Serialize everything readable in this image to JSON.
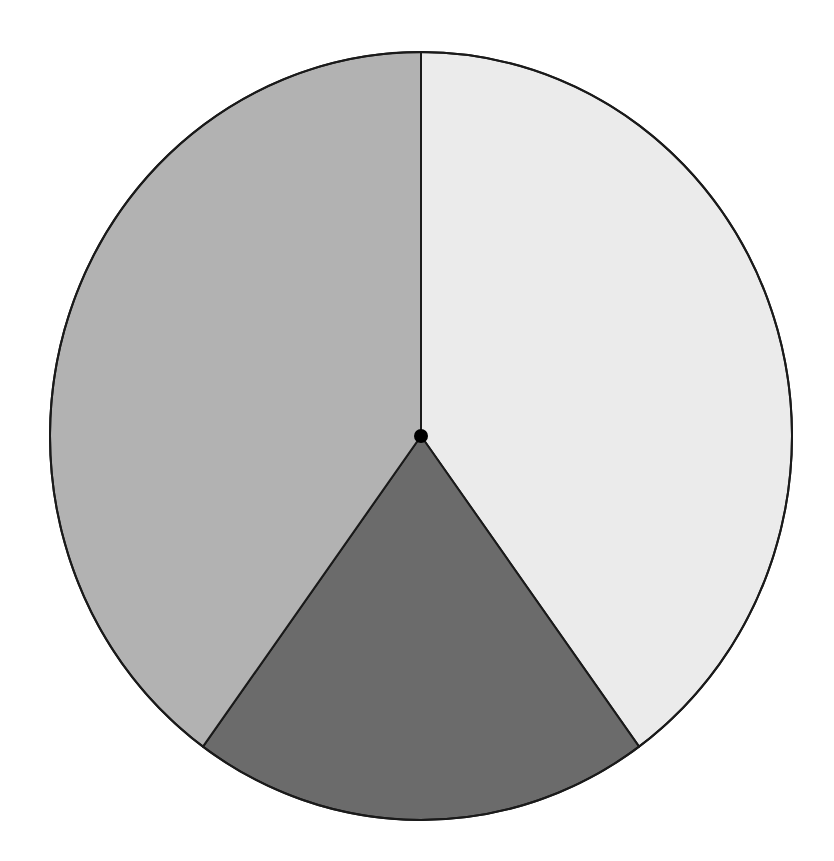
{
  "chart_data": {
    "type": "pie",
    "title": "",
    "categories": [
      "Slice A",
      "Slice B",
      "Slice C"
    ],
    "values": [
      40,
      20,
      40
    ],
    "colors": [
      "#ebebeb",
      "#6b6b6b",
      "#b2b2b2"
    ],
    "start_angle_deg": 0,
    "direction": "clockwise",
    "legend": "none",
    "labels_visible": false,
    "center_dot": true
  },
  "layout": {
    "cx": 421,
    "cy": 436,
    "rx": 371,
    "ry": 384,
    "stroke": "#1a1a1a",
    "stroke_width": 2,
    "center_dot_radius": 7
  }
}
